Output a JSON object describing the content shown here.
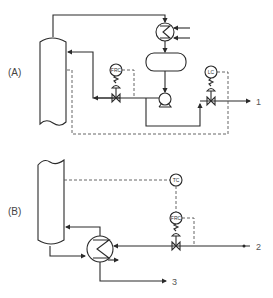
{
  "diagram": {
    "type": "process-flow-schematic",
    "panels": [
      {
        "id": "A",
        "label": "(A)",
        "equipment": [
          "column-top",
          "overhead-condenser",
          "reflux-drum",
          "reflux-pump"
        ],
        "instruments": [
          {
            "tag": "FRC",
            "role": "reflux flow recorder-controller"
          },
          {
            "tag": "LC",
            "role": "distillate controller"
          }
        ],
        "streams": [
          {
            "number": "1",
            "description": "distillate product out"
          }
        ]
      },
      {
        "id": "B",
        "label": "(B)",
        "equipment": [
          "column-bottom",
          "reboiler"
        ],
        "instruments": [
          {
            "tag": "TC",
            "role": "column temperature controller"
          },
          {
            "tag": "FRC",
            "role": "heating medium flow recorder-controller"
          }
        ],
        "streams": [
          {
            "number": "2",
            "description": "heating medium in"
          },
          {
            "number": "3",
            "description": "bottoms product out"
          }
        ]
      }
    ]
  },
  "labels": {
    "panel_a": "(A)",
    "panel_b": "(B)",
    "stream_1": "1",
    "stream_2": "2",
    "stream_3": "3",
    "inst_a_frc": "FRC",
    "inst_a_lc": "LC",
    "inst_b_tc": "TC",
    "inst_b_frc": "FRC"
  },
  "colors": {
    "line": "#2a2a2a",
    "signal": "#555555",
    "background": "#ffffff"
  }
}
